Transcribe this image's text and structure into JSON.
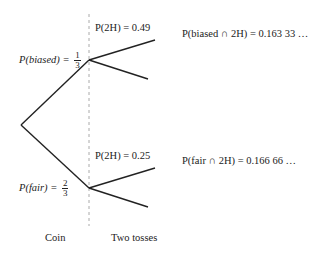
{
  "diagram": {
    "type": "probability-tree",
    "coin": {
      "biased": {
        "label": "P(biased) =",
        "prob_num": "1",
        "prob_den": "3"
      },
      "fair": {
        "label": "P(fair) =",
        "prob_num": "2",
        "prob_den": "3"
      }
    },
    "tosses": {
      "biased_2H": "P(2H) = 0.49",
      "fair_2H": "P(2H) = 0.25"
    },
    "outcomes": {
      "biased_and_2H": "P(biased ∩ 2H) = 0.163 33 …",
      "fair_and_2H": "P(fair ∩ 2H) = 0.166 66 …"
    },
    "columns": {
      "coin": "Coin",
      "tosses": "Two tosses"
    },
    "colors": {
      "line": "#222222",
      "divider": "#aaaaaa"
    }
  }
}
